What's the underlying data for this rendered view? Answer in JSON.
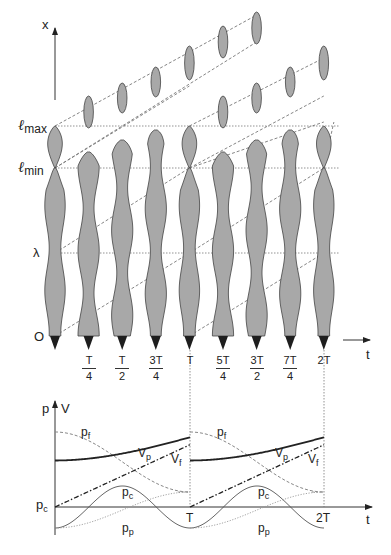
{
  "upper_diagram": {
    "axis_x_label": "x",
    "axis_t_label": "t",
    "levels": {
      "lmax": {
        "symbol": "ℓ",
        "sub": "max"
      },
      "lmin": {
        "symbol": "ℓ",
        "sub": "min"
      },
      "lambda": "λ",
      "origin": "O"
    },
    "time_ticks": [
      {
        "num": "T",
        "den": "4"
      },
      {
        "num": "T",
        "den": "2"
      },
      {
        "num": "3T",
        "den": "4"
      },
      {
        "num": "T",
        "den": ""
      },
      {
        "num": "5T",
        "den": "4"
      },
      {
        "num": "3T",
        "den": "2"
      },
      {
        "num": "7T",
        "den": "4"
      },
      {
        "num": "2T",
        "den": ""
      }
    ]
  },
  "lower_chart": {
    "y_axis_labels": [
      "p",
      "V"
    ],
    "x_axis_label": "t",
    "baseline_label": {
      "main": "p",
      "sub": "c"
    },
    "x_ticks": [
      "T",
      "2T"
    ],
    "curve_labels": {
      "pf": {
        "main": "p",
        "sub": "f"
      },
      "Vp": {
        "main": "V",
        "sub": "p"
      },
      "Vf": {
        "main": "V",
        "sub": "f"
      },
      "pc": {
        "main": "p",
        "sub": "c"
      },
      "pp": {
        "main": "p",
        "sub": "p"
      }
    }
  },
  "chart_data": {
    "type": "line",
    "title": "",
    "xlabel": "t",
    "ylabel": "p, V",
    "x": [
      "0",
      "T/4",
      "T/2",
      "3T/4",
      "T",
      "5T/4",
      "3T/2",
      "7T/4",
      "2T"
    ],
    "series": [
      {
        "name": "p_f (dashed)",
        "values": [
          1.0,
          0.93,
          0.72,
          0.45,
          0.2,
          0.93,
          0.72,
          0.45,
          0.2
        ]
      },
      {
        "name": "V_p (thick solid)",
        "values": [
          0.62,
          0.68,
          0.76,
          0.86,
          0.93,
          0.68,
          0.76,
          0.86,
          0.93
        ]
      },
      {
        "name": "V_f (dash-dot)",
        "values": [
          0.0,
          0.18,
          0.38,
          0.6,
          0.82,
          0.18,
          0.38,
          0.6,
          0.82
        ]
      },
      {
        "name": "p_c (thin solid sinusoid)",
        "values": [
          -0.28,
          0.0,
          0.28,
          0.0,
          -0.28,
          0.0,
          0.28,
          0.0,
          -0.28
        ]
      },
      {
        "name": "p_p (dotted)",
        "values": [
          -0.28,
          -0.24,
          -0.12,
          0.05,
          0.2,
          -0.24,
          -0.12,
          0.05,
          0.2
        ]
      }
    ],
    "baseline": "p_c",
    "period_markers": [
      "T",
      "2T"
    ],
    "grid": false
  }
}
